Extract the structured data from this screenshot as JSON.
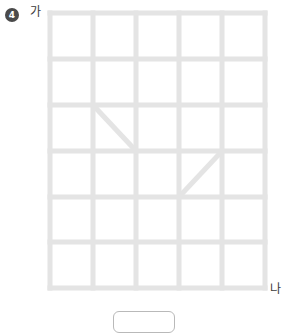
{
  "problem": {
    "number": "4",
    "number_badge_color": "#4a4a4a"
  },
  "labels": {
    "top_left": "가",
    "bottom_right": "나"
  },
  "answer_input": {
    "value": "",
    "placeholder": ""
  },
  "figure": {
    "type": "grid",
    "columns": 5,
    "rows": 6,
    "line_color": "#e4e4e4",
    "line_width": 5,
    "cell_width": 43,
    "cell_height": 46,
    "origin_x": 3,
    "origin_y": 3,
    "vertical_line_x": [
      3,
      46,
      89,
      132,
      175,
      218
    ],
    "horizontal_line_y": [
      3,
      49,
      95,
      141,
      187,
      232,
      278
    ],
    "diagonals": [
      {
        "name": "diagonal-upper-left",
        "x1": 46,
        "y1": 95,
        "x2": 89,
        "y2": 141,
        "direction": "down-right",
        "cell_col": 2,
        "cell_row": 3
      },
      {
        "name": "diagonal-lower-right",
        "x1": 132,
        "y1": 187,
        "x2": 175,
        "y2": 141,
        "direction": "up-right",
        "cell_col": 4,
        "cell_row": 4
      }
    ],
    "corner_points": [
      {
        "name": "point-ga",
        "x": 3,
        "y": 3
      },
      {
        "name": "point-na",
        "x": 218,
        "y": 278
      }
    ]
  }
}
